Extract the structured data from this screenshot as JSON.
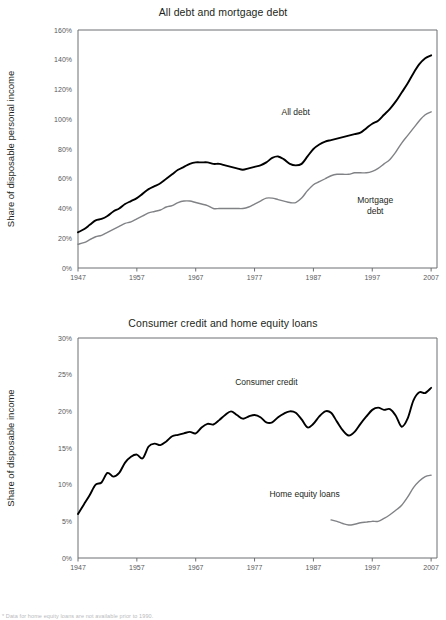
{
  "footnote": "* Data for home equity loans are not available prior to 1990.",
  "chart_data": [
    {
      "id": "all-debt-and-mortgage-debt",
      "type": "line",
      "title": "All debt and mortgage debt",
      "xlabel": "",
      "ylabel": "Share of disposable personal income",
      "xlim": [
        1947,
        2008
      ],
      "ylim": [
        0,
        160
      ],
      "xticks": [
        1947,
        1957,
        1967,
        1977,
        1987,
        1997,
        2007
      ],
      "yticks": [
        0,
        20,
        40,
        60,
        80,
        100,
        120,
        140,
        160
      ],
      "ytick_labels": [
        "0%",
        "20%",
        "40%",
        "60%",
        "80%",
        "100%",
        "120%",
        "140%",
        "160%"
      ],
      "grid": false,
      "legend": "inline-annotations",
      "annotations": [
        {
          "name": "all-debt",
          "text": "All debt",
          "x": 1984.0,
          "y": 103.0
        },
        {
          "name": "mortgage-debt",
          "text": "Mortgage\ndebt",
          "x": 1997.5,
          "y": 44.0
        }
      ],
      "series": [
        {
          "name": "All debt",
          "color": "#000000",
          "x": [
            1947,
            1948,
            1949,
            1950,
            1951,
            1952,
            1953,
            1954,
            1955,
            1956,
            1957,
            1958,
            1959,
            1960,
            1961,
            1962,
            1963,
            1964,
            1965,
            1966,
            1967,
            1968,
            1969,
            1970,
            1971,
            1972,
            1973,
            1974,
            1975,
            1976,
            1977,
            1978,
            1979,
            1980,
            1981,
            1982,
            1983,
            1984,
            1985,
            1986,
            1987,
            1988,
            1989,
            1990,
            1991,
            1992,
            1993,
            1994,
            1995,
            1996,
            1997,
            1998,
            1999,
            2000,
            2001,
            2002,
            2003,
            2004,
            2005,
            2006,
            2007
          ],
          "values": [
            24,
            26,
            29,
            32,
            33,
            35,
            38,
            40,
            43,
            45,
            47,
            50,
            53,
            55,
            57,
            60,
            63,
            66,
            68,
            70,
            71,
            71,
            71,
            70,
            70,
            69,
            68,
            67,
            66,
            67,
            68,
            69,
            71,
            74,
            75,
            73,
            70,
            69,
            70,
            75,
            80,
            83,
            85,
            86,
            87,
            88,
            89,
            90,
            91,
            94,
            97,
            99,
            103,
            107,
            112,
            118,
            124,
            131,
            137,
            141,
            143
          ]
        },
        {
          "name": "Mortgage debt",
          "color": "#808285",
          "x": [
            1947,
            1948,
            1949,
            1950,
            1951,
            1952,
            1953,
            1954,
            1955,
            1956,
            1957,
            1958,
            1959,
            1960,
            1961,
            1962,
            1963,
            1964,
            1965,
            1966,
            1967,
            1968,
            1969,
            1970,
            1971,
            1972,
            1973,
            1974,
            1975,
            1976,
            1977,
            1978,
            1979,
            1980,
            1981,
            1982,
            1983,
            1984,
            1985,
            1986,
            1987,
            1988,
            1989,
            1990,
            1991,
            1992,
            1993,
            1994,
            1995,
            1996,
            1997,
            1998,
            1999,
            2000,
            2001,
            2002,
            2003,
            2004,
            2005,
            2006,
            2007
          ],
          "values": [
            16,
            17,
            19,
            21,
            22,
            24,
            26,
            28,
            30,
            31,
            33,
            35,
            37,
            38,
            39,
            41,
            42,
            44,
            45,
            45,
            44,
            43,
            42,
            40,
            40,
            40,
            40,
            40,
            40,
            41,
            43,
            45,
            47,
            47,
            46,
            45,
            44,
            44,
            47,
            52,
            56,
            58,
            60,
            62,
            63,
            63,
            63,
            64,
            64,
            64,
            65,
            67,
            70,
            73,
            78,
            84,
            89,
            94,
            99,
            103,
            105
          ]
        }
      ]
    },
    {
      "id": "consumer-credit-and-home-equity-loans",
      "type": "line",
      "title": "Consumer credit and home equity loans",
      "xlabel": "",
      "ylabel": "Share of disposable income",
      "xlim": [
        1947,
        2008
      ],
      "ylim": [
        0,
        30
      ],
      "xticks": [
        1947,
        1957,
        1967,
        1977,
        1987,
        1997,
        2007
      ],
      "yticks": [
        0,
        5,
        10,
        15,
        20,
        25,
        30
      ],
      "ytick_labels": [
        "0%",
        "5%",
        "10%",
        "15%",
        "20%",
        "25%",
        "30%"
      ],
      "grid": false,
      "legend": "inline-annotations",
      "annotations": [
        {
          "name": "consumer-credit",
          "text": "Consumer credit",
          "x": 1979.0,
          "y": 23.6
        },
        {
          "name": "home-equity-loans",
          "text": "Home equity loans",
          "x": 1985.5,
          "y": 8.3
        }
      ],
      "series": [
        {
          "name": "Consumer credit",
          "color": "#000000",
          "x": [
            1947,
            1948,
            1949,
            1950,
            1951,
            1952,
            1953,
            1954,
            1955,
            1956,
            1957,
            1958,
            1959,
            1960,
            1961,
            1962,
            1963,
            1964,
            1965,
            1966,
            1967,
            1968,
            1969,
            1970,
            1971,
            1972,
            1973,
            1974,
            1975,
            1976,
            1977,
            1978,
            1979,
            1980,
            1981,
            1982,
            1983,
            1984,
            1985,
            1986,
            1987,
            1988,
            1989,
            1990,
            1991,
            1992,
            1993,
            1994,
            1995,
            1996,
            1997,
            1998,
            1999,
            2000,
            2001,
            2002,
            2003,
            2004,
            2005,
            2006,
            2007
          ],
          "values": [
            6.0,
            7.3,
            8.6,
            10.0,
            10.3,
            11.6,
            11.1,
            11.6,
            13.0,
            13.8,
            14.1,
            13.6,
            15.2,
            15.6,
            15.4,
            15.9,
            16.6,
            16.8,
            17.0,
            17.2,
            17.0,
            17.8,
            18.3,
            18.2,
            18.8,
            19.5,
            20.0,
            19.5,
            19.0,
            19.3,
            19.5,
            19.2,
            18.5,
            18.5,
            19.2,
            19.7,
            20.0,
            19.8,
            18.9,
            17.8,
            18.3,
            19.3,
            20.0,
            19.8,
            18.6,
            17.4,
            16.7,
            17.2,
            18.3,
            19.3,
            20.2,
            20.5,
            20.2,
            20.3,
            19.4,
            17.9,
            19.0,
            21.5,
            22.6,
            22.5,
            23.2,
            24.5,
            25.5,
            25.9,
            26.0,
            25.8,
            25.5
          ]
        },
        {
          "name": "Home equity loans",
          "color": "#808285",
          "x": [
            1990,
            1991,
            1992,
            1993,
            1994,
            1995,
            1996,
            1997,
            1998,
            1999,
            2000,
            2001,
            2002,
            2003,
            2004,
            2005,
            2006,
            2007
          ],
          "values": [
            5.2,
            5.0,
            4.7,
            4.5,
            4.6,
            4.8,
            4.9,
            5.0,
            5.0,
            5.4,
            5.9,
            6.5,
            7.2,
            8.3,
            9.6,
            10.5,
            11.1,
            11.3
          ]
        }
      ]
    }
  ]
}
